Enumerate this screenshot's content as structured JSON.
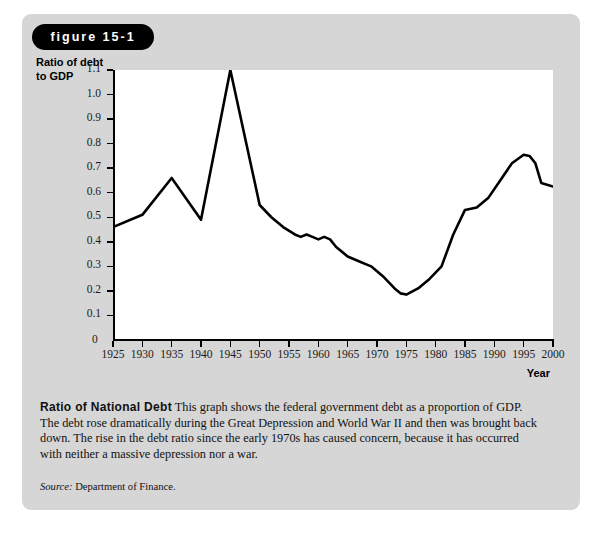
{
  "figure": {
    "badge_label": "figure 15-1"
  },
  "caption": {
    "heading": "Ratio of National Debt",
    "body": "This graph shows the federal government debt as a proportion of GDP. The debt rose dramatically during the Great Depression and World War II and then was brought back down. The rise in the debt ratio since the early 1970s has caused concern, because it has occurred with neither a massive depression nor a war.",
    "source_prefix": "Source:",
    "source_text": "Department of Finance."
  },
  "chart_data": {
    "type": "line",
    "title": "Ratio of National Debt",
    "xlabel": "Year",
    "ylabel": "Ratio of debt to GDP",
    "ylabel_line1": "Ratio of debt",
    "ylabel_line2": "to GDP",
    "xlim": [
      1925,
      2000
    ],
    "ylim": [
      0,
      1.1
    ],
    "grid": false,
    "legend": false,
    "line_color": "#000000",
    "ytick_labels": [
      "1.1",
      "1.0",
      "0.9",
      "0.8",
      "0.7",
      "0.6",
      "0.5",
      "0.4",
      "0.3",
      "0.2",
      "0.1",
      "0"
    ],
    "ytick_values": [
      1.1,
      1.0,
      0.9,
      0.8,
      0.7,
      0.6,
      0.5,
      0.4,
      0.3,
      0.2,
      0.1,
      0
    ],
    "xtick_labels": [
      "1925",
      "1930",
      "1935",
      "1940",
      "1945",
      "1950",
      "1955",
      "1960",
      "1965",
      "1970",
      "1975",
      "1980",
      "1985",
      "1990",
      "1995",
      "2000"
    ],
    "xtick_values": [
      1925,
      1930,
      1935,
      1940,
      1945,
      1950,
      1955,
      1960,
      1965,
      1970,
      1975,
      1980,
      1985,
      1990,
      1995,
      2000
    ],
    "x": [
      1925,
      1930,
      1935,
      1940,
      1945,
      1950,
      1952,
      1954,
      1956,
      1957,
      1958,
      1959,
      1960,
      1961,
      1962,
      1963,
      1965,
      1967,
      1969,
      1971,
      1973,
      1974,
      1975,
      1977,
      1979,
      1981,
      1983,
      1985,
      1987,
      1989,
      1991,
      1993,
      1995,
      1996,
      1997,
      1998,
      2000
    ],
    "y": [
      0.46,
      0.51,
      0.66,
      0.49,
      1.1,
      0.55,
      0.5,
      0.46,
      0.43,
      0.42,
      0.43,
      0.42,
      0.41,
      0.42,
      0.41,
      0.38,
      0.34,
      0.32,
      0.3,
      0.26,
      0.21,
      0.19,
      0.185,
      0.21,
      0.25,
      0.3,
      0.43,
      0.53,
      0.54,
      0.58,
      0.65,
      0.72,
      0.755,
      0.75,
      0.72,
      0.64,
      0.625
    ]
  }
}
